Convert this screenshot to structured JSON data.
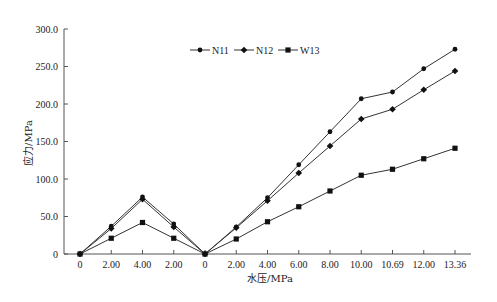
{
  "chart_data": {
    "type": "line",
    "title": "",
    "xlabel": "水压/MPa",
    "ylabel": "应力/MPa",
    "categories": [
      "0",
      "2.00",
      "4.00",
      "2.00",
      "0",
      "2.00",
      "4.00",
      "6.00",
      "8.00",
      "10.00",
      "10.69",
      "12.00",
      "13.36"
    ],
    "ylim": [
      0,
      300
    ],
    "yticks": [
      "0",
      "50.0",
      "100.0",
      "150.0",
      "200.0",
      "250.0",
      "300.0"
    ],
    "ytick_values": [
      0,
      50,
      100,
      150,
      200,
      250,
      300
    ],
    "grid": false,
    "legend_position": "top-center",
    "series": [
      {
        "name": "N11",
        "marker": "circle",
        "values": [
          0,
          37,
          76,
          40,
          0,
          36,
          75,
          119,
          163,
          207,
          216,
          247,
          273
        ]
      },
      {
        "name": "N12",
        "marker": "diamond",
        "values": [
          0,
          34,
          73,
          36,
          0,
          35,
          71,
          108,
          144,
          180,
          193,
          219,
          244
        ]
      },
      {
        "name": "W13",
        "marker": "square",
        "values": [
          0,
          21,
          42,
          21,
          0,
          20,
          43,
          63,
          84,
          105,
          113,
          127,
          141
        ]
      }
    ]
  },
  "colors": {
    "line": "#333333",
    "marker": "#111111",
    "axis": "#555555"
  }
}
